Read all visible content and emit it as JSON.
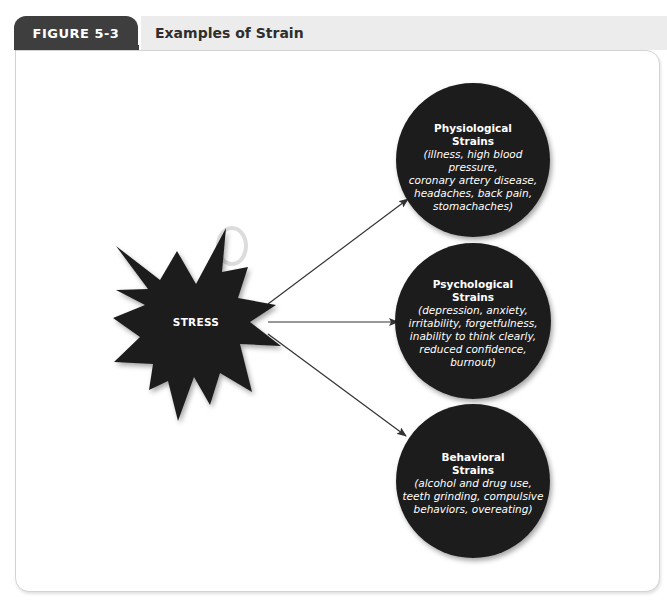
{
  "figure": {
    "number_label": "FIGURE 5-3",
    "title": "Examples of Strain"
  },
  "diagram": {
    "source": {
      "label": "STRESS",
      "shape": "starburst"
    },
    "targets": [
      {
        "title": "Physiological Strains",
        "title_lines": [
          "Physiological",
          "Strains"
        ],
        "examples_lines": [
          "(illness, high blood pressure,",
          "coronary artery disease,",
          "headaches, back pain,",
          "stomachaches)"
        ],
        "examples": [
          "illness",
          "high blood pressure",
          "coronary artery disease",
          "headaches",
          "back pain",
          "stomachaches"
        ]
      },
      {
        "title": "Psychological Strains",
        "title_lines": [
          "Psychological",
          "Strains"
        ],
        "examples_lines": [
          "(depression, anxiety,",
          "irritability, forgetfulness,",
          "inability to think clearly,",
          "reduced confidence,",
          "burnout)"
        ],
        "examples": [
          "depression",
          "anxiety",
          "irritability",
          "forgetfulness",
          "inability to think clearly",
          "reduced confidence",
          "burnout"
        ]
      },
      {
        "title": "Behavioral Strains",
        "title_lines": [
          "Behavioral",
          "Strains"
        ],
        "examples_lines": [
          "(alcohol and drug use,",
          "teeth grinding, compulsive",
          "behaviors, overeating)"
        ],
        "examples": [
          "alcohol and drug use",
          "teeth grinding",
          "compulsive behaviors",
          "overeating"
        ]
      }
    ],
    "edges": [
      {
        "from": "STRESS",
        "to": "Physiological Strains"
      },
      {
        "from": "STRESS",
        "to": "Psychological Strains"
      },
      {
        "from": "STRESS",
        "to": "Behavioral Strains"
      }
    ],
    "colors": {
      "shape_fill": "#1e1e1e",
      "text": "#ffffff",
      "arrow": "#333333",
      "tab_bg": "#3e3e3e",
      "title_strip_bg": "#ececec"
    }
  }
}
